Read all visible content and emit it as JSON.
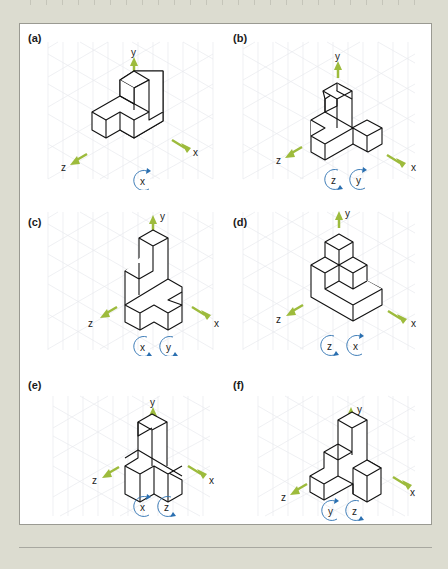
{
  "figure": {
    "colors": {
      "axis_arrow": "#9dbb3c",
      "rotation_arrow": "#2a6fb0",
      "grid": "#e6e8ec",
      "edge": "#111111",
      "background": "#dcdcd0",
      "panel_bg": "#ffffff"
    },
    "panels": [
      {
        "id": "a",
        "label": "(a)",
        "axes": {
          "y": "y",
          "x": "x",
          "z": "z"
        },
        "rotations": [
          "x"
        ]
      },
      {
        "id": "b",
        "label": "(b)",
        "axes": {
          "y": "y",
          "x": "x",
          "z": "z"
        },
        "rotations": [
          "z",
          "y"
        ]
      },
      {
        "id": "c",
        "label": "(c)",
        "axes": {
          "y": "y",
          "x": "x",
          "z": "z"
        },
        "rotations": [
          "x",
          "y"
        ]
      },
      {
        "id": "d",
        "label": "(d)",
        "axes": {
          "y": "y",
          "x": "x",
          "z": "z"
        },
        "rotations": [
          "z",
          "x"
        ]
      },
      {
        "id": "e",
        "label": "(e)",
        "axes": {
          "y": "y",
          "x": "x",
          "z": "z"
        },
        "rotations": [
          "x",
          "z"
        ]
      },
      {
        "id": "f",
        "label": "(f)",
        "axes": {
          "y": "y",
          "x": "x",
          "z": "z"
        },
        "rotations": [
          "y",
          "z"
        ]
      }
    ]
  }
}
